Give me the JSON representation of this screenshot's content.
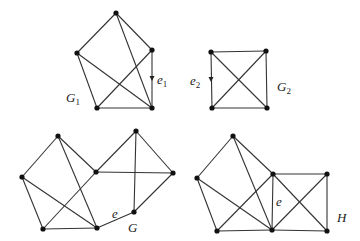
{
  "graphs": [
    {
      "id": "G1",
      "label": "G",
      "label_sub": "1",
      "label_pos": [
        66,
        102
      ],
      "vertices": [
        [
          116,
          13
        ],
        [
          77,
          53
        ],
        [
          152,
          50
        ],
        [
          97,
          108
        ],
        [
          152,
          108
        ]
      ],
      "edges": [
        [
          0,
          1
        ],
        [
          0,
          2
        ],
        [
          0,
          4
        ],
        [
          1,
          4
        ],
        [
          1,
          3
        ],
        [
          3,
          4
        ],
        [
          3,
          2
        ],
        [
          2,
          4
        ]
      ],
      "marked_edge": {
        "label": "e",
        "label_sub": "1",
        "edge": [
          2,
          4
        ],
        "label_pos": [
          157,
          84
        ],
        "arrow_at": [
          152,
          79
        ]
      }
    },
    {
      "id": "G2",
      "label": "G",
      "label_sub": "2",
      "label_pos": [
        277,
        91
      ],
      "vertices": [
        [
          211,
          52
        ],
        [
          266,
          51
        ],
        [
          212,
          108
        ],
        [
          267,
          108
        ]
      ],
      "edges": [
        [
          0,
          1
        ],
        [
          0,
          2
        ],
        [
          0,
          3
        ],
        [
          1,
          2
        ],
        [
          1,
          3
        ],
        [
          2,
          3
        ]
      ],
      "marked_edge": {
        "label": "e",
        "label_sub": "2",
        "edge": [
          0,
          2
        ],
        "label_pos": [
          190,
          85
        ],
        "arrow_at": [
          211,
          80
        ]
      }
    },
    {
      "id": "G",
      "label": "G",
      "label_sub": "",
      "label_pos": [
        128,
        232
      ],
      "vertices": [
        [
          58,
          136
        ],
        [
          22,
          177
        ],
        [
          43,
          229
        ],
        [
          97,
          228
        ],
        [
          96,
          172
        ],
        [
          136,
          131
        ],
        [
          173,
          173
        ],
        [
          134,
          212
        ]
      ],
      "edges": [
        [
          0,
          1
        ],
        [
          0,
          3
        ],
        [
          0,
          4
        ],
        [
          1,
          2
        ],
        [
          1,
          3
        ],
        [
          2,
          3
        ],
        [
          2,
          4
        ],
        [
          4,
          5
        ],
        [
          4,
          6
        ],
        [
          5,
          6
        ],
        [
          5,
          7
        ],
        [
          6,
          7
        ],
        [
          3,
          7
        ]
      ],
      "marked_edge": {
        "label": "e",
        "label_sub": "",
        "edge": [
          3,
          7
        ],
        "label_pos": [
          112,
          218
        ]
      }
    },
    {
      "id": "H",
      "label": "H",
      "label_sub": "",
      "label_pos": [
        337,
        222
      ],
      "vertices": [
        [
          233,
          136
        ],
        [
          197,
          178
        ],
        [
          217,
          231
        ],
        [
          272,
          230
        ],
        [
          273,
          174
        ],
        [
          327,
          174
        ],
        [
          327,
          231
        ]
      ],
      "edges": [
        [
          0,
          1
        ],
        [
          0,
          3
        ],
        [
          0,
          4
        ],
        [
          1,
          2
        ],
        [
          1,
          3
        ],
        [
          2,
          3
        ],
        [
          2,
          4
        ],
        [
          4,
          5
        ],
        [
          4,
          3
        ],
        [
          4,
          6
        ],
        [
          5,
          3
        ],
        [
          5,
          6
        ],
        [
          3,
          6
        ]
      ],
      "marked_edge": {
        "label": "e",
        "label_sub": "",
        "edge": [
          4,
          3
        ],
        "label_pos": [
          276,
          206
        ]
      }
    }
  ]
}
